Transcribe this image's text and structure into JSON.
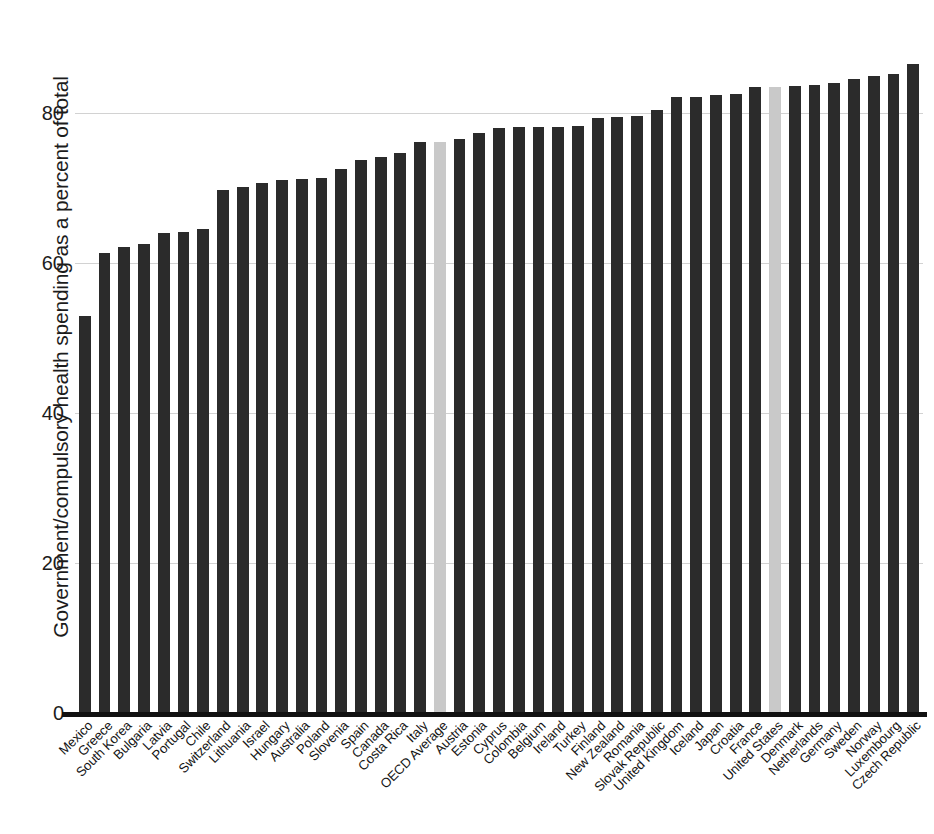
{
  "chart_data": {
    "type": "bar",
    "title": "",
    "xlabel": "",
    "ylabel": "Government/compulsory health spending as a percent of total",
    "ylim": [
      0,
      88
    ],
    "yticks": [
      0,
      20,
      40,
      60,
      80
    ],
    "ytick_labels": [
      "0",
      "20",
      "40",
      "60",
      "80"
    ],
    "grid": true,
    "legend": "none",
    "bar_color": "#2b2b2b",
    "highlight_color": "#c9c9c9",
    "highlighted_categories": [
      "OECD Average",
      "United States"
    ],
    "categories": [
      "Mexico",
      "Greece",
      "South Korea",
      "Bulgaria",
      "Latvia",
      "Portugal",
      "Chile",
      "Switzerland",
      "Lithuania",
      "Israel",
      "Hungary",
      "Australia",
      "Poland",
      "Slovenia",
      "Spain",
      "Canada",
      "Costa Rica",
      "Italy",
      "OECD Average",
      "Austria",
      "Estonia",
      "Cyprus",
      "Colombia",
      "Belgium",
      "Ireland",
      "Turkey",
      "Finland",
      "New Zealand",
      "Romania",
      "Slovak Republic",
      "United Kingdom",
      "Iceland",
      "Japan",
      "Croatia",
      "France",
      "United States",
      "Denmark",
      "Netherlands",
      "Germany",
      "Sweden",
      "Norway",
      "Luxembourg",
      "Czech Republic"
    ],
    "values": [
      52.9,
      61.4,
      62.2,
      62.6,
      64.0,
      64.1,
      64.6,
      69.7,
      70.2,
      70.7,
      71.1,
      71.2,
      71.3,
      72.6,
      73.7,
      74.2,
      74.7,
      76.2,
      76.2,
      76.6,
      77.3,
      78.0,
      78.1,
      78.2,
      78.2,
      78.3,
      79.3,
      79.5,
      79.6,
      80.4,
      82.1,
      82.2,
      82.4,
      82.5,
      83.5,
      83.5,
      83.6,
      83.7,
      84.0,
      84.5,
      85.0,
      85.2,
      86.6
    ],
    "units": "percent of total"
  },
  "axis": {
    "y_title": "Government/compulsory health spending as a percent of total"
  }
}
